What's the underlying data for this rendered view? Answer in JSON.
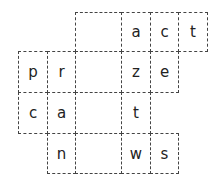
{
  "puzzle": {
    "type": "word-grid",
    "columns_x": [
      18,
      47,
      75,
      121,
      150,
      178,
      207
    ],
    "rows_y": [
      12,
      51,
      92,
      133,
      173
    ],
    "cells": [
      {
        "row": 0,
        "col": 2,
        "letter": ""
      },
      {
        "row": 0,
        "col": 3,
        "letter": "a"
      },
      {
        "row": 0,
        "col": 4,
        "letter": "c"
      },
      {
        "row": 0,
        "col": 5,
        "letter": "t"
      },
      {
        "row": 1,
        "col": 0,
        "letter": "p"
      },
      {
        "row": 1,
        "col": 1,
        "letter": "r"
      },
      {
        "row": 1,
        "col": 2,
        "letter": ""
      },
      {
        "row": 1,
        "col": 3,
        "letter": "z"
      },
      {
        "row": 1,
        "col": 4,
        "letter": "e"
      },
      {
        "row": 2,
        "col": 0,
        "letter": "c"
      },
      {
        "row": 2,
        "col": 1,
        "letter": "a"
      },
      {
        "row": 2,
        "col": 2,
        "letter": ""
      },
      {
        "row": 2,
        "col": 3,
        "letter": "t"
      },
      {
        "row": 3,
        "col": 1,
        "letter": "n"
      },
      {
        "row": 3,
        "col": 2,
        "letter": ""
      },
      {
        "row": 3,
        "col": 3,
        "letter": "w"
      },
      {
        "row": 3,
        "col": 4,
        "letter": "s"
      }
    ]
  }
}
